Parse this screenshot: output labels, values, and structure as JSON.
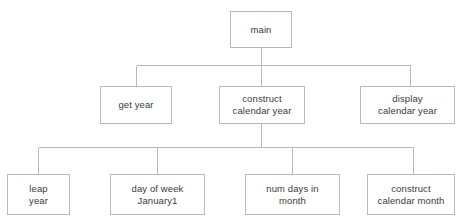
{
  "diagram": {
    "type": "structure-chart",
    "style": {
      "box_border_color": "#b9b9b9",
      "box_fill_color": "#ffffff",
      "connector_color": "#b9b9b9",
      "text_color": "#3a3a3a",
      "background_color": "#ffffff"
    },
    "levels": [
      {
        "level": 1,
        "nodes": [
          {
            "id": "main",
            "label": "main",
            "x": 230,
            "y": 11,
            "w": 62,
            "h": 37
          }
        ]
      },
      {
        "level": 2,
        "nodes": [
          {
            "id": "get-year",
            "label": "get year",
            "x": 100,
            "y": 86,
            "w": 72,
            "h": 38
          },
          {
            "id": "construct-calendar-year",
            "label": "construct\ncalendar year",
            "x": 219,
            "y": 86,
            "w": 86,
            "h": 38
          },
          {
            "id": "display-calendar-year",
            "label": "display\ncalendar year",
            "x": 360,
            "y": 86,
            "w": 95,
            "h": 38
          }
        ]
      },
      {
        "level": 3,
        "nodes": [
          {
            "id": "leap-year",
            "label": "leap\nyear",
            "x": 7,
            "y": 174,
            "w": 63,
            "h": 41
          },
          {
            "id": "day-of-week-january1",
            "label": "day of week\nJanuary1",
            "x": 110,
            "y": 174,
            "w": 95,
            "h": 41
          },
          {
            "id": "num-days-in-month",
            "label": "num days in\nmonth",
            "x": 245,
            "y": 174,
            "w": 95,
            "h": 41
          },
          {
            "id": "construct-calendar-month",
            "label": "construct\ncalendar month",
            "x": 367,
            "y": 174,
            "w": 88,
            "h": 41
          }
        ]
      }
    ],
    "connectors": {
      "level1_to_level2": {
        "parent_drop": {
          "x": 261,
          "y1": 48,
          "y2": 86
        },
        "bus": {
          "y": 65,
          "x1": 136,
          "x2": 410
        },
        "child_risers": [
          {
            "x": 136,
            "y1": 65,
            "y2": 86
          },
          {
            "x": 410,
            "y1": 65,
            "y2": 86
          }
        ]
      },
      "level2_to_level3": {
        "parent_drop": {
          "x": 261,
          "y1": 124,
          "y2": 174
        },
        "bus": {
          "y": 147,
          "x1": 38,
          "x2": 413
        },
        "child_risers": [
          {
            "x": 38,
            "y1": 147,
            "y2": 174
          },
          {
            "x": 157,
            "y1": 147,
            "y2": 174
          },
          {
            "x": 292,
            "y1": 147,
            "y2": 174
          },
          {
            "x": 413,
            "y1": 147,
            "y2": 174
          }
        ]
      }
    }
  }
}
